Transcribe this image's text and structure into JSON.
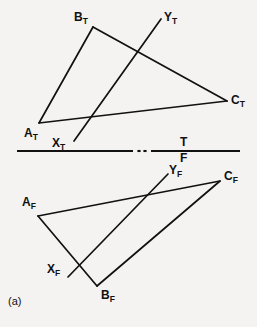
{
  "figure": {
    "caption": "(a)",
    "background_color": "#f4f3f1",
    "line_color": "#111111"
  },
  "folding_line": {
    "top_label": "T",
    "front_label": "F",
    "y": 151,
    "x_start": 17,
    "x_end": 240,
    "break_gap": {
      "start": 133,
      "end": 151
    },
    "dots": 2
  },
  "top_view": {
    "name": "top-view",
    "points": {
      "A_T": {
        "label_base": "A",
        "label_sub": "T",
        "x": 39,
        "y": 123,
        "label_x": 24,
        "label_y": 127
      },
      "B_T": {
        "label_base": "B",
        "label_sub": "T",
        "x": 93,
        "y": 27,
        "label_x": 74,
        "label_y": 11
      },
      "C_T": {
        "label_base": "C",
        "label_sub": "T",
        "x": 227,
        "y": 101,
        "label_x": 231,
        "label_y": 94
      },
      "X_T": {
        "label_base": "X",
        "label_sub": "T",
        "x": 74,
        "y": 141,
        "label_x": 52,
        "label_y": 137
      },
      "Y_T": {
        "label_base": "Y",
        "label_sub": "T",
        "x": 161,
        "y": 19,
        "label_x": 164,
        "label_y": 11
      }
    },
    "edges": [
      {
        "name": "edge-AB",
        "from": "A_T",
        "to": "B_T"
      },
      {
        "name": "edge-BC",
        "from": "B_T",
        "to": "C_T"
      },
      {
        "name": "edge-CA",
        "from": "C_T",
        "to": "A_T"
      },
      {
        "name": "line-XY",
        "from": "X_T",
        "to": "Y_T"
      }
    ]
  },
  "front_view": {
    "name": "front-view",
    "points": {
      "A_F": {
        "label_base": "A",
        "label_sub": "F",
        "x": 38,
        "y": 216,
        "label_x": 22,
        "label_y": 196
      },
      "B_F": {
        "label_base": "B",
        "label_sub": "F",
        "x": 97,
        "y": 286,
        "label_x": 101,
        "label_y": 289
      },
      "C_F": {
        "label_base": "C",
        "label_sub": "F",
        "x": 220,
        "y": 181,
        "label_x": 224,
        "label_y": 170
      },
      "X_F": {
        "label_base": "X",
        "label_sub": "F",
        "x": 68,
        "y": 277,
        "label_x": 47,
        "label_y": 263
      },
      "Y_F": {
        "label_base": "Y",
        "label_sub": "F",
        "x": 168,
        "y": 174,
        "label_x": 169,
        "label_y": 164
      }
    },
    "edges": [
      {
        "name": "edge-AB",
        "from": "A_F",
        "to": "B_F"
      },
      {
        "name": "edge-BC",
        "from": "B_F",
        "to": "C_F"
      },
      {
        "name": "edge-CA",
        "from": "C_F",
        "to": "A_F"
      },
      {
        "name": "line-XY",
        "from": "X_F",
        "to": "Y_F"
      }
    ]
  },
  "caption_position": {
    "x": 8,
    "y": 296
  }
}
